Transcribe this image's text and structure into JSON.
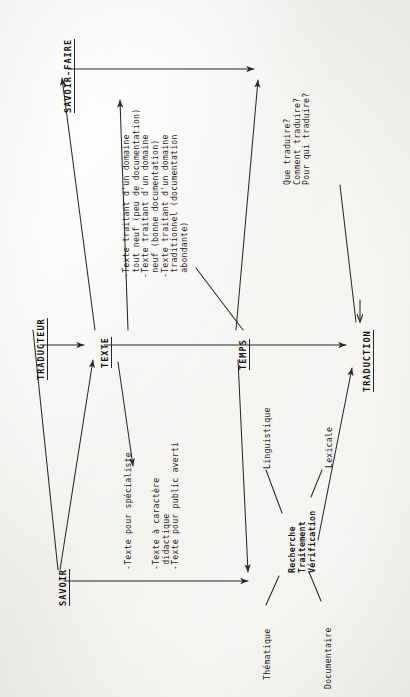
{
  "document": {
    "kind": "scanned-diagram",
    "orientation": "rotated-90-ccw",
    "language": "fr",
    "background_color": "#f4f3f1",
    "ink_color": "#23211f"
  },
  "nodes": {
    "traducteur": "TRADUCTEUR",
    "savoir_faire": "SAVOIR-FAIRE",
    "savoir": "SAVOIR",
    "texte": "TEXTE",
    "temps": "TEMPS",
    "traduction": "TRADUCTION"
  },
  "annotations": {
    "texte_top": "-Texte traitant d'un domaine\n tout neuf (peu de documentation)\n-Texte traitant d'un domaine\n neuf (bonne documentation)\n-Texte traitant d'un domaine\n traditionnel (documentation\n abondante)",
    "texte_bottom_1": "-Texte pour spécialiste",
    "texte_bottom_2": "-Texte à caractère\n didactique\n-Texte pour public averti",
    "questions": "Que traduire?\nComment traduire?\nPour qui traduire?"
  },
  "process_cluster": {
    "core": "Recherche\nTraitement\nVérification",
    "branches": [
      {
        "id": "linguistique",
        "label": "Linguistique"
      },
      {
        "id": "lexicale",
        "label": "Lexicale"
      },
      {
        "id": "thematique",
        "label": "Thématique"
      },
      {
        "id": "documentaire",
        "label": "Documentaire"
      }
    ]
  },
  "edges": [
    {
      "id": "traducteur-to-texte",
      "from": "TRADUCTEUR",
      "to": "TEXTE",
      "style": "solid-arrow"
    },
    {
      "id": "texte-to-savoir-faire",
      "from": "TEXTE",
      "to": "SAVOIR-FAIRE",
      "style": "solid-arrow"
    },
    {
      "id": "savoir-to-texte",
      "from": "SAVOIR",
      "to": "TEXTE",
      "style": "solid-arrow"
    },
    {
      "id": "savoir-faire-to-temps",
      "from": "SAVOIR-FAIRE",
      "to": "TEMPS",
      "style": "solid-arrow"
    },
    {
      "id": "savoir-to-temps",
      "from": "SAVOIR",
      "to": "TEMPS",
      "style": "solid-arrow"
    },
    {
      "id": "texte-to-temps",
      "from": "TEXTE",
      "to": "TEMPS",
      "style": "solid-arrow"
    },
    {
      "id": "temps-to-traduction",
      "from": "TEMPS",
      "to": "TRADUCTION",
      "style": "solid-arrow"
    },
    {
      "id": "cluster-to-traduction",
      "from": "process-cluster",
      "to": "TRADUCTION",
      "style": "solid-arrow"
    },
    {
      "id": "temps-to-cluster",
      "from": "TEMPS",
      "to": "process-cluster",
      "style": "solid-arrow"
    }
  ]
}
